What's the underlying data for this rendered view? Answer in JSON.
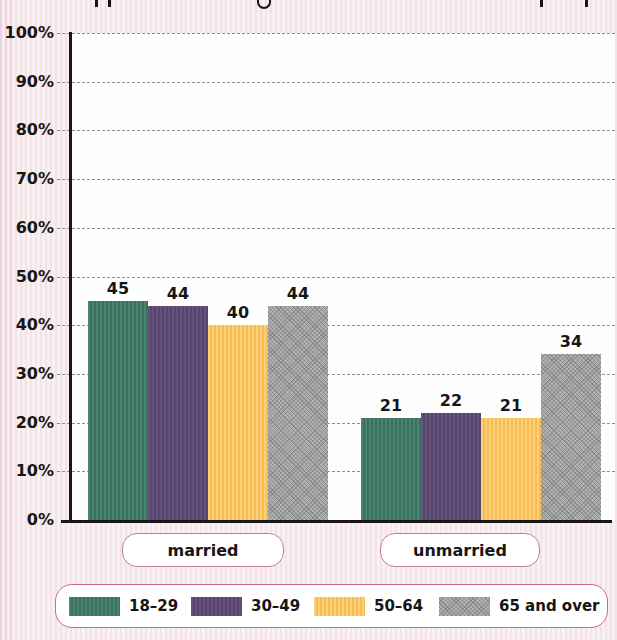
{
  "chart_data": {
    "type": "bar",
    "categories": [
      "married",
      "unmarried"
    ],
    "series": [
      {
        "name": "18–29",
        "color": "#3f7a68",
        "texture": "vertical-stripes",
        "values": [
          45,
          21
        ]
      },
      {
        "name": "30–49",
        "color": "#5f4b75",
        "texture": "vertical-stripes",
        "values": [
          44,
          22
        ]
      },
      {
        "name": "50–64",
        "color": "#f9c45f",
        "texture": "vertical-stripes",
        "values": [
          40,
          21
        ]
      },
      {
        "name": "65 and over",
        "color": "#ababab",
        "texture": "crosshatch",
        "values": [
          44,
          34
        ]
      }
    ],
    "show_values": true,
    "xlabel": "",
    "ylabel": "",
    "ylim": [
      0,
      100
    ],
    "yticks": [
      "0%",
      "10%",
      "20%",
      "30%",
      "40%",
      "50%",
      "60%",
      "70%",
      "80%",
      "90%",
      "100%"
    ],
    "grid": true,
    "gridline_style": "dashed",
    "legend_position": "bottom"
  },
  "colors": {
    "page_background": "#f8f0f2",
    "plot_background": "#fefefe",
    "axis": "#161616",
    "gridline": "#8f8f8f",
    "category_box_border": "#c27f8e",
    "legend_border": "#ce6a7d",
    "label_text": "#161616"
  }
}
